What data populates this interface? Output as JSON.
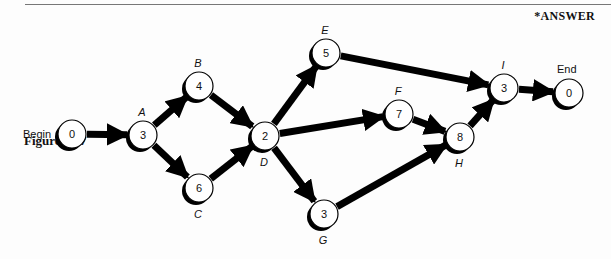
{
  "header": {
    "answer_tag": "*ANSWER"
  },
  "figure": {
    "caption": "Figure 3.17"
  },
  "diagram": {
    "type": "activity-on-node network",
    "begin_label": "Begin",
    "end_label": "End",
    "nodes": [
      {
        "id": "begin",
        "label": "",
        "duration": "0",
        "x": 72,
        "y": 134
      },
      {
        "id": "A",
        "label": "A",
        "duration": "3",
        "x": 143,
        "y": 135
      },
      {
        "id": "B",
        "label": "B",
        "duration": "4",
        "x": 199,
        "y": 86
      },
      {
        "id": "C",
        "label": "C",
        "duration": "6",
        "x": 199,
        "y": 188
      },
      {
        "id": "D",
        "label": "D",
        "duration": "2",
        "x": 265,
        "y": 136
      },
      {
        "id": "E",
        "label": "E",
        "duration": "5",
        "x": 326,
        "y": 53
      },
      {
        "id": "F",
        "label": "F",
        "duration": "7",
        "x": 399,
        "y": 114
      },
      {
        "id": "G",
        "label": "G",
        "duration": "3",
        "x": 324,
        "y": 214
      },
      {
        "id": "H",
        "label": "H",
        "duration": "8",
        "x": 460,
        "y": 137
      },
      {
        "id": "I",
        "label": "I",
        "duration": "3",
        "x": 504,
        "y": 88
      },
      {
        "id": "end",
        "label": "",
        "duration": "0",
        "x": 569,
        "y": 93
      }
    ],
    "edges": [
      [
        "begin",
        "A"
      ],
      [
        "A",
        "B"
      ],
      [
        "A",
        "C"
      ],
      [
        "B",
        "D"
      ],
      [
        "C",
        "D"
      ],
      [
        "D",
        "E"
      ],
      [
        "D",
        "F"
      ],
      [
        "D",
        "G"
      ],
      [
        "E",
        "I"
      ],
      [
        "F",
        "H"
      ],
      [
        "G",
        "H"
      ],
      [
        "H",
        "I"
      ],
      [
        "I",
        "end"
      ]
    ]
  }
}
